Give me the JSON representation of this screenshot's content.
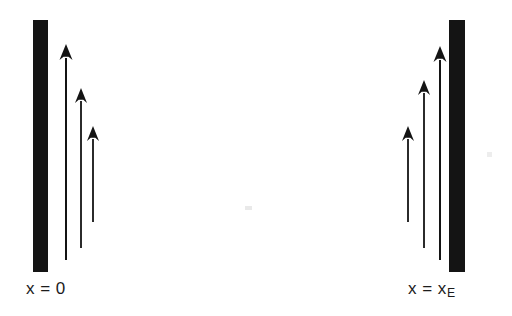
{
  "figure": {
    "type": "physics-boundary-diagram",
    "background_color": "#ffffff",
    "ink_color": "#141414",
    "width": 512,
    "height": 316
  },
  "walls": [
    {
      "id": "left-wall",
      "name": "left-boundary-wall",
      "x": 33,
      "y": 20,
      "width": 15,
      "height": 252,
      "color": "#141414"
    },
    {
      "id": "right-wall",
      "name": "right-boundary-wall",
      "x": 449,
      "y": 20,
      "width": 16,
      "height": 252,
      "color": "#141414"
    }
  ],
  "labels": [
    {
      "id": "left-label",
      "name": "x-equals-zero-label",
      "text_prefix": "x = 0",
      "subscript": "",
      "x": 26,
      "y": 280
    },
    {
      "id": "right-label",
      "name": "x-equals-xe-label",
      "text_prefix": "x = x",
      "subscript": "E",
      "x": 408,
      "y": 280
    }
  ],
  "arrow_groups": [
    {
      "id": "left-group",
      "name": "left-arrow-group",
      "description": "three upward arrows adjacent to the left wall, decreasing in length to the right",
      "arrows": [
        {
          "name": "left-arrow-1",
          "x": 66,
          "tip_y": 44,
          "tail_y": 260,
          "head_width": 13,
          "head_height": 16,
          "shaft_width": 2.0
        },
        {
          "name": "left-arrow-2",
          "x": 81,
          "tip_y": 88,
          "tail_y": 248,
          "head_width": 12,
          "head_height": 15,
          "shaft_width": 1.8
        },
        {
          "name": "left-arrow-3",
          "x": 93,
          "tip_y": 126,
          "tail_y": 222,
          "head_width": 12,
          "head_height": 15,
          "shaft_width": 1.8
        }
      ]
    },
    {
      "id": "right-group",
      "name": "right-arrow-group",
      "description": "three upward arrows adjacent to the right wall, increasing in length to the right",
      "arrows": [
        {
          "name": "right-arrow-1",
          "x": 408,
          "tip_y": 126,
          "tail_y": 222,
          "head_width": 12,
          "head_height": 15,
          "shaft_width": 1.8
        },
        {
          "name": "right-arrow-2",
          "x": 424,
          "tip_y": 80,
          "tail_y": 248,
          "head_width": 12,
          "head_height": 15,
          "shaft_width": 1.8
        },
        {
          "name": "right-arrow-3",
          "x": 440,
          "tip_y": 46,
          "tail_y": 260,
          "head_width": 13,
          "head_height": 16,
          "shaft_width": 2.0
        }
      ]
    }
  ],
  "artifacts": [
    {
      "name": "scan-smudge-center",
      "x": 245,
      "y": 206,
      "width": 7,
      "height": 4,
      "color": "#e9e9e9"
    },
    {
      "name": "scan-smudge-right",
      "x": 487,
      "y": 152,
      "width": 5,
      "height": 5,
      "color": "#ededed"
    }
  ]
}
